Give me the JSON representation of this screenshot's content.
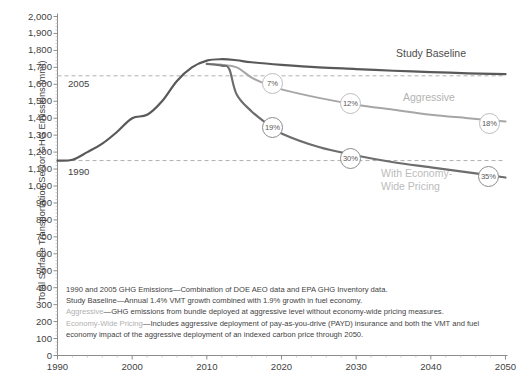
{
  "chart_data": {
    "type": "line",
    "title": "",
    "xlabel": "",
    "ylabel": "Total Surface Transportation Sector GHG Emissions (mmt)",
    "xlim": [
      1990,
      2050
    ],
    "ylim": [
      0,
      2000
    ],
    "x_ticks": [
      "1990",
      "2000",
      "2010",
      "2020",
      "2030",
      "2040",
      "2050"
    ],
    "y_ticks": [
      "2,000",
      "1,900",
      "1,800",
      "1,700",
      "1,600",
      "1,500",
      "1,400",
      "1,300",
      "1,200",
      "1,100",
      "1,000",
      "900",
      "800",
      "700",
      "600",
      "500",
      "400",
      "300",
      "200",
      "100",
      "0"
    ],
    "grid": false,
    "legend_position": "inline-right",
    "reference_lines": [
      {
        "label": "2005",
        "value": 1650,
        "style": "dashed"
      },
      {
        "label": "1990",
        "value": 1150,
        "style": "dashed"
      }
    ],
    "series": [
      {
        "name": "Study Baseline",
        "color": "#595959",
        "x": [
          1990,
          1992,
          1994,
          1996,
          1998,
          2000,
          2002,
          2004,
          2006,
          2008,
          2010,
          2012,
          2014,
          2016,
          2020,
          2025,
          2030,
          2035,
          2040,
          2045,
          2050
        ],
        "values": [
          1150,
          1155,
          1200,
          1250,
          1320,
          1400,
          1420,
          1500,
          1620,
          1700,
          1740,
          1748,
          1742,
          1730,
          1715,
          1700,
          1690,
          1680,
          1672,
          1665,
          1660
        ]
      },
      {
        "name": "Aggressive",
        "color": "#a6a6a6",
        "x": [
          2010,
          2012,
          2014,
          2016,
          2018,
          2020,
          2025,
          2030,
          2035,
          2040,
          2045,
          2050
        ],
        "values": [
          1720,
          1715,
          1700,
          1640,
          1600,
          1570,
          1520,
          1480,
          1450,
          1420,
          1400,
          1380
        ],
        "labels": [
          {
            "x": 2018,
            "value": 1600,
            "text": "7%"
          },
          {
            "x": 2030,
            "value": 1480,
            "text": "12%"
          },
          {
            "x": 2049,
            "value": 1385,
            "text": "18%"
          }
        ]
      },
      {
        "name": "With Economy-Wide Pricing",
        "color": "#6d6d6d",
        "x": [
          2010,
          2012,
          2013,
          2014,
          2016,
          2018,
          2020,
          2025,
          2030,
          2035,
          2040,
          2045,
          2050
        ],
        "values": [
          1720,
          1710,
          1690,
          1540,
          1440,
          1370,
          1310,
          1230,
          1180,
          1140,
          1110,
          1080,
          1050
        ],
        "labels": [
          {
            "x": 2018,
            "value": 1370,
            "text": "19%"
          },
          {
            "x": 2030,
            "value": 1180,
            "text": "30%"
          },
          {
            "x": 2049,
            "value": 1060,
            "text": "35%"
          }
        ]
      }
    ],
    "annotations": [
      {
        "text": "Study Baseline",
        "kind": "series-label"
      },
      {
        "text": "Aggressive",
        "kind": "series-label"
      },
      {
        "text": "With Economy-\nWide Pricing",
        "kind": "series-label"
      }
    ]
  },
  "axis": {
    "y_title": "Total Surface Transportation Sector GHG Emissions (mmt)",
    "y_ticks": [
      "2,000",
      "1,900",
      "1,800",
      "1,700",
      "1,600",
      "1,500",
      "1,400",
      "1,300",
      "1,200",
      "1,100",
      "1,000",
      "900",
      "800",
      "700",
      "600",
      "500",
      "400",
      "300",
      "200",
      "100",
      "0"
    ],
    "x_ticks": [
      "1990",
      "2000",
      "2010",
      "2020",
      "2030",
      "2040",
      "2050"
    ]
  },
  "reference_labels": {
    "l1990": "1990",
    "l2005": "2005"
  },
  "series_labels": {
    "baseline": "Study Baseline",
    "aggressive": "Aggressive",
    "pricing": "With Economy-\nWide Pricing"
  },
  "bubbles": {
    "aggressive_7": "7%",
    "aggressive_12": "12%",
    "aggressive_18": "18%",
    "pricing_19": "19%",
    "pricing_30": "30%",
    "pricing_35": "35%"
  },
  "footnotes": {
    "line1": "1990 and 2005 GHG Emissions—Combination of DOE AEO data and EPA GHG Inventory data.",
    "line2": "Study Baseline—Annual 1.4% VMT growth combined with 1.9% growth in fuel economy.",
    "line3_term": "Aggressive",
    "line3_rest": "—GHG emissions from bundle deployed at aggressive level without economy-wide pricing measures.",
    "line4_term": "Economy-Wide Pricing",
    "line4_rest": "—Includes aggressive deployment of pay-as-you-drive (PAYD) insurance and both the VMT and fuel economy impact of the aggressive deployment of an indexed carbon price through 2050."
  },
  "colors": {
    "baseline": "#595959",
    "aggressive": "#a6a6a6",
    "pricing": "#6d6d6d",
    "axis": "#8c8c8c",
    "text": "#3f3f3f",
    "dashed": "#b0b0b0"
  }
}
